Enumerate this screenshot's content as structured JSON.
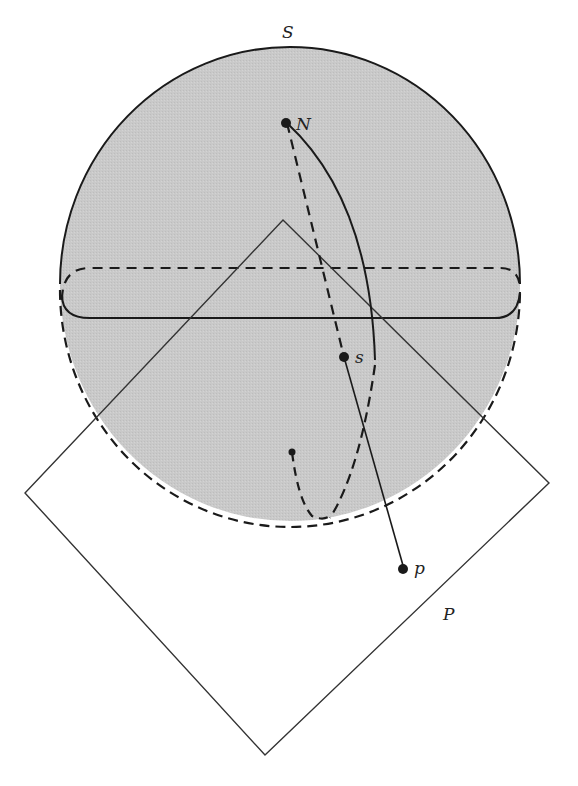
{
  "diagram": {
    "type": "stereographic-projection",
    "colors": {
      "sphere_fill": "#c8c8c8",
      "stroke": "#1a1a1a",
      "background": "#ffffff"
    },
    "labels": {
      "sphere": "S",
      "north_pole": "N",
      "sphere_point": "s",
      "plane_point": "p",
      "plane": "P"
    }
  }
}
